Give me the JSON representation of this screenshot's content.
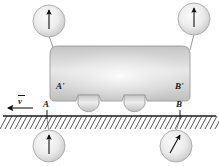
{
  "figure": {
    "background_color": "#ffffff",
    "ink_color": "#1a1a1a",
    "body_fill_light": "#f2f2f2",
    "body_fill_dark": "#b9b9b9",
    "circle_fill_light": "#f7f7f7",
    "circle_fill_dark": "#c9c9c9"
  },
  "labels": {
    "velocity": "v",
    "point_a": "A",
    "point_b": "B",
    "point_a_prime": "A'",
    "point_b_prime": "B'"
  },
  "insets": [
    {
      "id": "inset-a-prime",
      "label": "A'",
      "position": "top-left",
      "arrow": "up",
      "arrow_angle_deg": 0
    },
    {
      "id": "inset-b-prime",
      "label": "B'",
      "position": "top-right",
      "arrow": "up",
      "arrow_angle_deg": 0
    },
    {
      "id": "inset-a",
      "label": "A",
      "position": "bottom-left",
      "arrow": "up",
      "arrow_angle_deg": 0
    },
    {
      "id": "inset-b",
      "label": "B",
      "position": "bottom-right",
      "arrow": "up-right",
      "arrow_angle_deg": 28
    }
  ],
  "ground": {
    "hatching": true,
    "hatch_direction": "right-leaning"
  },
  "cart": {
    "wheels": 2,
    "direction_of_motion": "left"
  }
}
